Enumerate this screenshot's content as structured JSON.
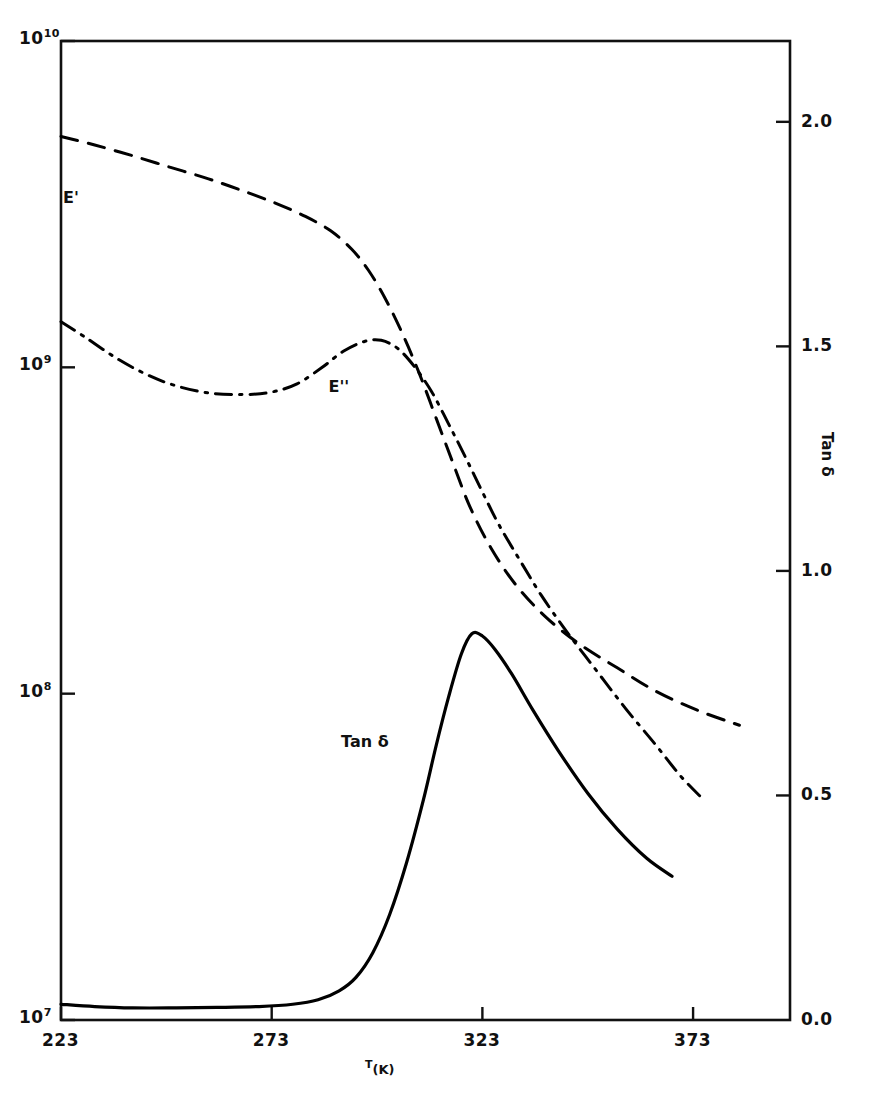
{
  "chart_data": {
    "type": "line",
    "title": "",
    "xlabel": "T (K)",
    "ylabel_left": "E' , E''  (Pa)",
    "ylabel_right": "Tan δ",
    "grid": false,
    "legend_position": "inline-curve-labels",
    "x_axis": {
      "label": "T",
      "unit": "(K)",
      "ticks": [
        223,
        273,
        323,
        373
      ],
      "tick_labels": [
        "223",
        "273",
        "323",
        "373"
      ],
      "xlim": [
        223,
        396
      ]
    },
    "y_axis_left": {
      "scale": "log",
      "ticks": [
        10000000,
        100000000,
        1000000000,
        10000000000
      ],
      "tick_labels": [
        "10⁷",
        "10⁸",
        "10⁹",
        "10¹⁰"
      ],
      "tick_mantissa": [
        "10",
        "10",
        "10",
        "10"
      ],
      "tick_exponent": [
        "7",
        "8",
        "9",
        "10"
      ],
      "ylim": [
        10000000,
        10000000000
      ]
    },
    "y_axis_right": {
      "scale": "linear",
      "label": "Tan δ",
      "ticks": [
        0.0,
        0.5,
        1.0,
        1.5,
        2.0
      ],
      "tick_labels": [
        "0.0",
        "0.5",
        "1.0",
        "1.5",
        "2.0"
      ],
      "ylim": [
        0.0,
        2.18
      ]
    },
    "series": [
      {
        "name": "E'",
        "label": "E'",
        "axis": "left",
        "linestyle": "dashed",
        "color": "#000000",
        "label_position": {
          "x": 223,
          "y": 1.83
        },
        "points": [
          {
            "x": 223.0,
            "y": 5100000000.0
          },
          {
            "x": 231.0,
            "y": 4800000000.0
          },
          {
            "x": 240.0,
            "y": 4450000000.0
          },
          {
            "x": 249.0,
            "y": 4100000000.0
          },
          {
            "x": 258.0,
            "y": 3780000000.0
          },
          {
            "x": 266.0,
            "y": 3480000000.0
          },
          {
            "x": 274.0,
            "y": 3180000000.0
          },
          {
            "x": 281.0,
            "y": 2900000000.0
          },
          {
            "x": 287.0,
            "y": 2620000000.0
          },
          {
            "x": 292.0,
            "y": 2300000000.0
          },
          {
            "x": 296.0,
            "y": 1980000000.0
          },
          {
            "x": 300.0,
            "y": 1620000000.0
          },
          {
            "x": 304.0,
            "y": 1270000000.0
          },
          {
            "x": 308.0,
            "y": 960000000.0
          },
          {
            "x": 312.0,
            "y": 700000000.0
          },
          {
            "x": 316.0,
            "y": 510000000.0
          },
          {
            "x": 320.0,
            "y": 375000000.0
          },
          {
            "x": 325.0,
            "y": 280000000.0
          },
          {
            "x": 331.0,
            "y": 215000000.0
          },
          {
            "x": 338.0,
            "y": 172000000.0
          },
          {
            "x": 346.0,
            "y": 142000000.0
          },
          {
            "x": 355.0,
            "y": 120000000.0
          },
          {
            "x": 364.0,
            "y": 102000000.0
          },
          {
            "x": 374.0,
            "y": 89000000.0
          },
          {
            "x": 384.0,
            "y": 80000000.0
          }
        ]
      },
      {
        "name": "E''",
        "label": "E''",
        "axis": "left",
        "linestyle": "dashdot",
        "color": "#000000",
        "label_position": {
          "x": 286,
          "y": 1.41
        },
        "points": [
          {
            "x": 223.0,
            "y": 1380000000.0
          },
          {
            "x": 229.0,
            "y": 1230000000.0
          },
          {
            "x": 236.0,
            "y": 1070000000.0
          },
          {
            "x": 243.0,
            "y": 955000000.0
          },
          {
            "x": 250.0,
            "y": 880000000.0
          },
          {
            "x": 258.0,
            "y": 835000000.0
          },
          {
            "x": 266.0,
            "y": 825000000.0
          },
          {
            "x": 273.0,
            "y": 840000000.0
          },
          {
            "x": 279.0,
            "y": 890000000.0
          },
          {
            "x": 285.0,
            "y": 1000000000.0
          },
          {
            "x": 290.0,
            "y": 1120000000.0
          },
          {
            "x": 295.0,
            "y": 1200000000.0
          },
          {
            "x": 299.0,
            "y": 1210000000.0
          },
          {
            "x": 303.0,
            "y": 1140000000.0
          },
          {
            "x": 307.0,
            "y": 1000000000.0
          },
          {
            "x": 311.0,
            "y": 840000000.0
          },
          {
            "x": 315.0,
            "y": 670000000.0
          },
          {
            "x": 319.0,
            "y": 530000000.0
          },
          {
            "x": 323.0,
            "y": 415000000.0
          },
          {
            "x": 327.0,
            "y": 328000000.0
          },
          {
            "x": 332.0,
            "y": 255000000.0
          },
          {
            "x": 337.0,
            "y": 200000000.0
          },
          {
            "x": 343.0,
            "y": 155000000.0
          },
          {
            "x": 350.0,
            "y": 118000000.0
          },
          {
            "x": 357.0,
            "y": 90000000.0
          },
          {
            "x": 364.0,
            "y": 70000000.0
          },
          {
            "x": 370.0,
            "y": 56000000.0
          },
          {
            "x": 375.0,
            "y": 48000000.0
          }
        ]
      },
      {
        "name": "Tan delta",
        "label": "Tan δ",
        "axis": "right",
        "linestyle": "solid",
        "color": "#000000",
        "label_position": {
          "x": 289,
          "y": 0.62
        },
        "peak": {
          "x": 320.5,
          "y": 0.86
        },
        "points": [
          {
            "x": 223.0,
            "y": 0.035
          },
          {
            "x": 231.0,
            "y": 0.03
          },
          {
            "x": 240.0,
            "y": 0.027
          },
          {
            "x": 250.0,
            "y": 0.027
          },
          {
            "x": 260.0,
            "y": 0.028
          },
          {
            "x": 270.0,
            "y": 0.03
          },
          {
            "x": 278.0,
            "y": 0.035
          },
          {
            "x": 284.0,
            "y": 0.045
          },
          {
            "x": 289.0,
            "y": 0.065
          },
          {
            "x": 293.0,
            "y": 0.095
          },
          {
            "x": 297.0,
            "y": 0.15
          },
          {
            "x": 301.0,
            "y": 0.235
          },
          {
            "x": 305.0,
            "y": 0.35
          },
          {
            "x": 309.0,
            "y": 0.49
          },
          {
            "x": 312.0,
            "y": 0.61
          },
          {
            "x": 315.0,
            "y": 0.72
          },
          {
            "x": 318.0,
            "y": 0.815
          },
          {
            "x": 320.5,
            "y": 0.86
          },
          {
            "x": 323.0,
            "y": 0.855
          },
          {
            "x": 326.0,
            "y": 0.825
          },
          {
            "x": 330.0,
            "y": 0.77
          },
          {
            "x": 335.0,
            "y": 0.69
          },
          {
            "x": 341.0,
            "y": 0.6
          },
          {
            "x": 348.0,
            "y": 0.505
          },
          {
            "x": 355.0,
            "y": 0.425
          },
          {
            "x": 362.0,
            "y": 0.36
          },
          {
            "x": 368.0,
            "y": 0.32
          }
        ]
      }
    ]
  },
  "figure": {
    "frame_color": "#000000",
    "background_color": "#ffffff",
    "line_color": "#000000"
  }
}
